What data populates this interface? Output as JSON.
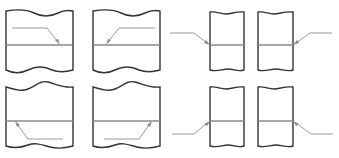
{
  "diagram": {
    "colors": {
      "outline": "#333333",
      "joint": "#8a8a8a",
      "leader": "#9a9a9a",
      "background": "#ffffff"
    },
    "panels": [
      {
        "id": "top-left-wide",
        "row": 1,
        "leader_side": "inside-left",
        "arrow_target": "joint-from-above"
      },
      {
        "id": "top-second-wide",
        "row": 1,
        "leader_side": "inside-right",
        "arrow_target": "joint-from-above"
      },
      {
        "id": "top-third-narrow",
        "row": 1,
        "leader_side": "outside-left",
        "arrow_target": "joint-from-above"
      },
      {
        "id": "top-fourth-narrow",
        "row": 1,
        "leader_side": "outside-right",
        "arrow_target": "joint-from-above"
      },
      {
        "id": "bottom-left-wide",
        "row": 2,
        "leader_side": "inside-left",
        "arrow_target": "joint-from-below"
      },
      {
        "id": "bottom-second-wide",
        "row": 2,
        "leader_side": "inside-right",
        "arrow_target": "joint-from-below"
      },
      {
        "id": "bottom-third-narrow",
        "row": 2,
        "leader_side": "outside-left",
        "arrow_target": "joint-from-below"
      },
      {
        "id": "bottom-fourth-narrow",
        "row": 2,
        "leader_side": "outside-right",
        "arrow_target": "joint-from-below"
      }
    ]
  }
}
